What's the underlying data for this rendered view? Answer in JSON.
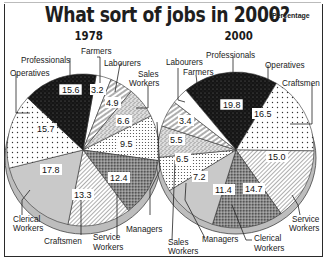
{
  "header": {
    "title": "What sort of jobs in 2000?",
    "unit": "Percentage"
  },
  "chart_data": [
    {
      "type": "pie",
      "title": "1978",
      "categories": [
        "Farmers",
        "Labourers",
        "Sales Workers",
        "Managers",
        "Service Workers",
        "Craftsmen",
        "Clerical Workers",
        "Operatives",
        "Professionals"
      ],
      "values": [
        3.2,
        4.9,
        6.6,
        9.5,
        12.4,
        13.3,
        17.8,
        15.7,
        15.6
      ],
      "unit": "Percentage"
    },
    {
      "type": "pie",
      "title": "2000",
      "categories": [
        "Professionals",
        "Operatives",
        "Craftsmen",
        "Service Workers",
        "Clerical Workers",
        "Managers",
        "Sales Workers",
        "Labourers",
        "Farmers"
      ],
      "values": [
        19.8,
        16.5,
        15.0,
        14.7,
        11.4,
        7.2,
        6.5,
        5.5,
        3.4
      ],
      "unit": "Percentage"
    }
  ],
  "charts": {
    "left": {
      "year": "1978",
      "labels": {
        "farmers": "Farmers",
        "labourers": "Labourers",
        "sales1": "Sales",
        "sales2": "Workers",
        "professionals": "Professionals",
        "operatives": "Operatives",
        "clerical1": "Clerical",
        "clerical2": "Workers",
        "craftsmen": "Craftsmen",
        "service1": "Service",
        "service2": "Workers",
        "managers": "Managers"
      },
      "values": {
        "farmers": "3.2",
        "labourers": "4.9",
        "sales": "6.6",
        "managers": "9.5",
        "service": "12.4",
        "craftsmen": "13.3",
        "clerical": "17.8",
        "operatives": "15.7",
        "professionals": "15.6"
      }
    },
    "right": {
      "year": "2000",
      "labels": {
        "labourers": "Labourers",
        "farmers": "Farmers",
        "professionals": "Professionals",
        "operatives": "Operatives",
        "craftsmen": "Craftsmen",
        "service1": "Service",
        "service2": "Workers",
        "clerical1": "Clerical",
        "clerical2": "Workers",
        "managers": "Managers",
        "sales1": "Sales",
        "sales2": "Workers"
      },
      "values": {
        "professionals": "19.8",
        "operatives": "16.5",
        "craftsmen": "15.0",
        "service": "14.7",
        "clerical": "11.4",
        "managers": "7.2",
        "sales": "6.5",
        "labourers": "5.5",
        "farmers": "3.4"
      }
    }
  }
}
